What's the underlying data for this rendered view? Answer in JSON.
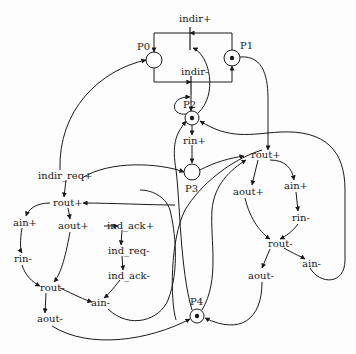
{
  "diagram": {
    "type": "petri-net / signal transition graph",
    "colors": {
      "ink": "#1a1a1a",
      "background": "#fdfdfd"
    },
    "places": [
      {
        "id": "P0",
        "label": "P0",
        "token": false
      },
      {
        "id": "P1",
        "label": "P1",
        "token": true
      },
      {
        "id": "P2",
        "label": "P2",
        "token": true
      },
      {
        "id": "P3",
        "label": "P3",
        "token": false
      },
      {
        "id": "P4",
        "label": "P4",
        "token": true
      }
    ],
    "transitions": {
      "indir_plus": "indir+",
      "indir_minus": "indir-",
      "rin_plus": "rin+",
      "right_rout_plus": "rout+",
      "right_aout_plus": "aout+",
      "right_ain_plus": "ain+",
      "right_rin_minus": "rin-",
      "right_rout_minus": "rout-",
      "right_aout_minus": "aout-",
      "right_ain_minus": "ain-",
      "indir_req_plus": "indir_req+",
      "left_rout_plus": "rout+",
      "left_ain_plus": "ain+",
      "left_aout_plus": "aout+",
      "ind_ack_plus": "ind_ack+",
      "ind_req_minus": "ind_req-",
      "ind_ack_minus": "ind_ack-",
      "left_rin_minus": "rin-",
      "left_rout_minus": "rout-",
      "left_ain_minus": "ain-",
      "left_aout_minus": "aout-"
    }
  }
}
